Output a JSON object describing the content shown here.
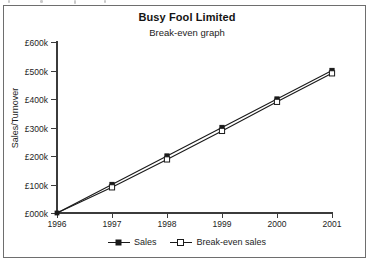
{
  "chart_data": {
    "type": "line",
    "title": "Busy Fool Limited",
    "subtitle": "Break-even graph",
    "xlabel": "",
    "ylabel": "Sales/Turnover",
    "categories": [
      "1996",
      "1997",
      "1998",
      "1999",
      "2000",
      "2001"
    ],
    "x": [
      1996,
      1997,
      1998,
      1999,
      2000,
      2001
    ],
    "series": [
      {
        "name": "Sales",
        "marker": "filled-square",
        "line": "solid",
        "color": "#1a1a1a",
        "values": [
          0,
          100000,
          200000,
          300000,
          400000,
          500000
        ]
      },
      {
        "name": "Break-even sales",
        "marker": "hollow-square",
        "line": "solid",
        "color": "#1a1a1a",
        "values": [
          0,
          90000,
          188000,
          288000,
          390000,
          490000
        ]
      }
    ],
    "ylim": [
      0,
      600000
    ],
    "ytick_labels": [
      "£000k",
      "£100k",
      "£200k",
      "£300k",
      "£400k",
      "£500k",
      "£600k"
    ],
    "ytick_values": [
      0,
      100000,
      200000,
      300000,
      400000,
      500000,
      600000
    ],
    "xtick_labels": [
      "1996",
      "1997",
      "1998",
      "1999",
      "2000",
      "2001"
    ],
    "grid": false,
    "legend_position": "bottom",
    "legend": [
      "Sales",
      "Break-even sales"
    ]
  },
  "legend": {
    "entries": [
      {
        "label": "Sales",
        "marker": "filled-square-marker"
      },
      {
        "label": "Break-even sales",
        "marker": "hollow-square-marker"
      }
    ]
  }
}
